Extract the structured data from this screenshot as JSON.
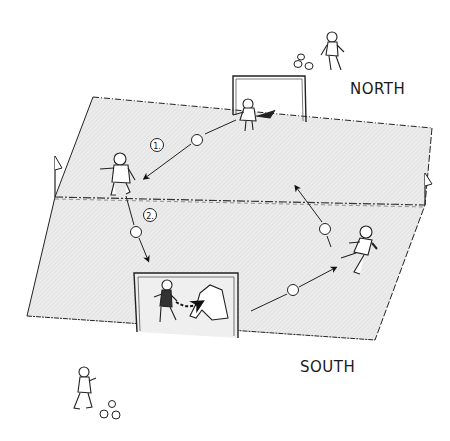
{
  "diagram": {
    "type": "soccer-drill-illustration",
    "labels": {
      "north": "NORTH",
      "south": "SOUTH"
    },
    "steps": [
      {
        "number": "1.",
        "description": "North goalkeeper throws ball to field player"
      },
      {
        "number": "2.",
        "description": "Field player passes ball toward south goal"
      }
    ],
    "colors": {
      "field_fill": "#e9e9e9",
      "line": "#1a1a1a",
      "background": "#ffffff"
    },
    "elements": {
      "field": "field-quadrilateral",
      "midline": "halfway-line",
      "goals": [
        "north-goal",
        "south-goal"
      ],
      "corner_flags": [
        "left-flag",
        "right-flag"
      ],
      "players": [
        "north-server",
        "north-goalkeeper",
        "field-player-left",
        "field-player-right",
        "south-goalkeeper-diving",
        "south-server"
      ],
      "ball_piles": [
        "north-ball-pile",
        "south-ball-pile"
      ]
    }
  }
}
